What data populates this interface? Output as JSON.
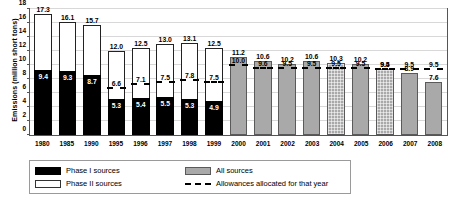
{
  "chart_data": {
    "type": "bar",
    "title": "",
    "xlabel": "",
    "ylabel": "Emissions (million short tons)",
    "ylim": [
      0,
      18
    ],
    "yticks": [
      0,
      2,
      4,
      6,
      8,
      10,
      12,
      14,
      16,
      18
    ],
    "grid": true,
    "legend_position": "bottom-left",
    "categories": [
      "1980",
      "1985",
      "1990",
      "1995",
      "1996",
      "1997",
      "1998",
      "1999",
      "2000",
      "2001",
      "2002",
      "2003",
      "2004",
      "2005",
      "2006",
      "2007",
      "2008"
    ],
    "series": [
      {
        "name": "Phase I sources",
        "values": [
          9.4,
          9.3,
          8.7,
          5.3,
          5.4,
          5.5,
          5.3,
          4.9,
          null,
          null,
          null,
          null,
          null,
          null,
          null,
          null,
          null
        ]
      },
      {
        "name": "Phase II sources",
        "note": "stacked on top of Phase I to reach total",
        "values": [
          7.9,
          6.8,
          7.0,
          6.7,
          7.1,
          7.5,
          7.8,
          7.6,
          null,
          null,
          null,
          null,
          null,
          null,
          null,
          null,
          null
        ]
      },
      {
        "name": "Total (Phase I + Phase II)",
        "values": [
          17.3,
          16.1,
          15.7,
          12.0,
          12.5,
          13.0,
          13.1,
          12.5,
          null,
          null,
          null,
          null,
          null,
          null,
          null,
          null,
          null
        ]
      },
      {
        "name": "All sources",
        "values": [
          null,
          null,
          null,
          null,
          null,
          null,
          null,
          null,
          11.2,
          10.6,
          10.2,
          10.6,
          10.3,
          10.2,
          9.5,
          8.9,
          7.6
        ]
      },
      {
        "name": "Allowances allocated for that year",
        "values": [
          null,
          null,
          null,
          6.6,
          7.1,
          7.5,
          7.8,
          7.5,
          10.0,
          9.6,
          9.5,
          9.5,
          9.5,
          9.5,
          9.4,
          9.5,
          9.5
        ]
      }
    ],
    "bar_top_labels": [
      "17.3",
      "16.1",
      "15.7",
      "12.0",
      "12.5",
      "13.0",
      "13.1",
      "12.5",
      "11.2",
      "10.6",
      "10.2",
      "10.6",
      "10.3",
      "10.2",
      "9.5",
      "8.9",
      "7.6"
    ],
    "phase1_labels": [
      "9.4",
      "9.3",
      "8.7",
      "5.3",
      "5.4",
      "5.5",
      "5.3",
      "4.9",
      "",
      "",
      "",
      "",
      "",
      "",
      "",
      "",
      ""
    ],
    "allowance_labels": [
      "",
      "",
      "",
      "6.6",
      "7.1",
      "7.5",
      "7.8",
      "7.5",
      "10.0",
      "9.6",
      "9.5",
      "9.5",
      "9.5",
      "9.5",
      "9.4",
      "9.5",
      "9.5"
    ]
  },
  "axis": {
    "y_title": "Emissions (million short tons)",
    "y_tick_0": "0",
    "y_tick_2": "2",
    "y_tick_4": "4",
    "y_tick_6": "6",
    "y_tick_8": "8",
    "y_tick_10": "10",
    "y_tick_12": "12",
    "y_tick_14": "14",
    "y_tick_16": "16",
    "y_tick_18": "18"
  },
  "legend": {
    "phase1": "Phase I sources",
    "phase2": "Phase II sources",
    "all": "All sources",
    "allowances": "Allowances allocated for that year"
  }
}
